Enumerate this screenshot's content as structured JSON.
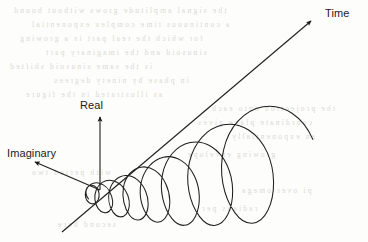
{
  "figure": {
    "background_color": "#fdfdfb",
    "stroke_color": "#1a1a1a",
    "axes": [
      {
        "key": "time",
        "label": "Time",
        "direction": "up-right",
        "from": [
          62,
          232
        ],
        "to": [
          312,
          20
        ]
      },
      {
        "key": "real",
        "label": "Real",
        "direction": "up",
        "from": [
          100,
          190
        ],
        "to": [
          100,
          116
        ]
      },
      {
        "key": "imaginary",
        "label": "Imaginary",
        "direction": "down-left",
        "from": [
          100,
          190
        ],
        "to": [
          34,
          162
        ]
      }
    ],
    "curve": {
      "type": "3d-helix",
      "description": "Complex exponential e^(st) traced as a helix whose radius grows exponentially along the time axis",
      "turns": 6,
      "amplitude_growth": "exponential",
      "start_point": [
        88,
        200
      ],
      "end_point": [
        300,
        40
      ]
    },
    "bleed_through": {
      "visible": true,
      "description": "faint mirrored text bleeding through from the reverse side of the scanned page",
      "rows": [
        {
          "text": "the signal amplitude grows without bound",
          "x": 12,
          "y": 6
        },
        {
          "text": "a continuous time complex exponential",
          "x": 30,
          "y": 20
        },
        {
          "text": "for which the real part is a growing",
          "x": 18,
          "y": 34
        },
        {
          "text": "sinusoid and the imaginary part",
          "x": 44,
          "y": 48
        },
        {
          "text": "is the same sinusoid shifted",
          "x": 8,
          "y": 62
        },
        {
          "text": "in phase by ninety degrees",
          "x": 52,
          "y": 76
        },
        {
          "text": "as illustrated in the figure",
          "x": 24,
          "y": 90
        },
        {
          "text": "the projection onto each",
          "x": 210,
          "y": 104
        },
        {
          "text": "coordinate plane gives",
          "x": 196,
          "y": 118
        },
        {
          "text": "an exponentially",
          "x": 230,
          "y": 132
        },
        {
          "text": "growing envelope",
          "x": 186,
          "y": 150
        },
        {
          "text": "with period two",
          "x": 30,
          "y": 168
        },
        {
          "text": "pi over omega",
          "x": 240,
          "y": 186
        },
        {
          "text": "radians per",
          "x": 200,
          "y": 204
        },
        {
          "text": "second here",
          "x": 56,
          "y": 220
        }
      ]
    }
  }
}
